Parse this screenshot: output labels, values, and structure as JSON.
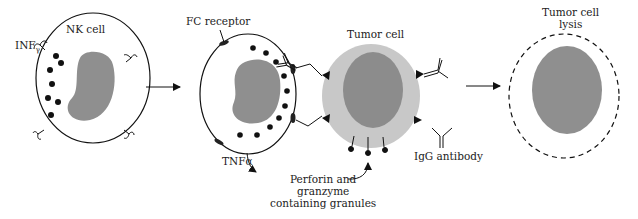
{
  "diagram": {
    "stages": [
      {
        "id": "nk-cell",
        "label": "NK cell"
      },
      {
        "id": "nk-tumor-engagement",
        "label": "Tumor cell"
      },
      {
        "id": "tumor-lysis",
        "label": "Tumor cell lysis"
      }
    ],
    "labels": {
      "nk_cell": "NK cell",
      "inf": "INF",
      "inf_sub": "γ",
      "fc_receptor": "FC receptor",
      "tumor_cell": "Tumor cell",
      "tnf": "TNFα",
      "perforin_line1": "Perforin and",
      "perforin_line2": "granzyme",
      "perforin_line3": "containing granules",
      "igg": "IgG antibody",
      "lysis_line1": "Tumor cell",
      "lysis_line2": "lysis"
    },
    "colors": {
      "nucleus": "#8f8f8f",
      "tumor_cytoplasm": "#c8c8c8",
      "tumor_nucleus": "#8c8c8c",
      "outline": "#111111",
      "background": "#ffffff"
    }
  }
}
